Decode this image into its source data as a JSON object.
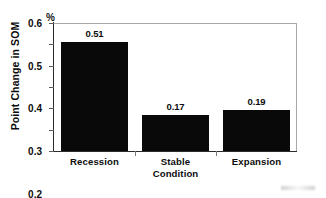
{
  "chart_data": {
    "type": "bar",
    "title": "",
    "xlabel": "",
    "ylabel": "Point Change in SOM",
    "unit_label": "%",
    "categories": [
      "Recession",
      "Stable Condition",
      "Expansion"
    ],
    "category_lines": [
      [
        "Recession"
      ],
      [
        "Stable",
        "Condition"
      ],
      [
        "Expansion"
      ]
    ],
    "values": [
      0.51,
      0.17,
      0.19
    ],
    "value_labels": [
      "0.51",
      "0.17",
      "0.19"
    ],
    "ylim": [
      0,
      0.6
    ],
    "ytick_labels": [
      "0",
      "0.1",
      "0.2",
      "0.3",
      "0.4",
      "0.5",
      "0.6"
    ],
    "ytick_values": [
      0,
      0.1,
      0.2,
      0.3,
      0.4,
      0.5,
      0.6
    ],
    "grid": false,
    "legend": false,
    "bar_color": "#090909",
    "frame_color": "#a8a8a8",
    "axis_color": "#2c2c2c"
  }
}
